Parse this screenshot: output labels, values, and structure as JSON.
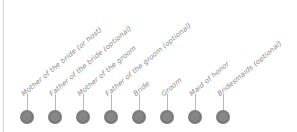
{
  "diagram": {
    "type": "role-timeline",
    "colors": {
      "dot": "#7a7a7a",
      "stem": "#b8b8b8",
      "label": "#8a8a8a",
      "edge": "#d4d4d4"
    },
    "roles": [
      {
        "label": "Mother of the bride (or host)",
        "icon": "person-icon"
      },
      {
        "label": "Father of the bride (optional)",
        "icon": "person-icon"
      },
      {
        "label": "Mother of the groom",
        "icon": "person-icon"
      },
      {
        "label": "Father of the groom (optional)",
        "icon": "person-icon"
      },
      {
        "label": "Bride",
        "icon": "person-icon"
      },
      {
        "label": "Groom",
        "icon": "person-icon"
      },
      {
        "label": "Maid of honor",
        "icon": "person-icon"
      },
      {
        "label": "Bridesmaids (optional)",
        "icon": "person-icon"
      }
    ]
  }
}
